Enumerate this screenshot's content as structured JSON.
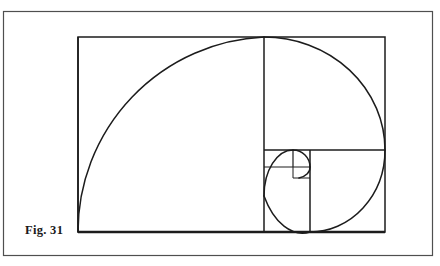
{
  "figure": {
    "caption": "Fig. 31",
    "ink_color": "#1c1c1c",
    "page_color": "#ffffff",
    "border_color": "#5a5a5a"
  },
  "chart_data": {
    "type": "diagram",
    "subtype": "golden-spiral",
    "title": "Fig. 31",
    "xlabel": "",
    "ylabel": "",
    "grid": false,
    "legend": null,
    "annotations": [
      "Fig. 31"
    ],
    "page_border": {
      "x": 3,
      "y": 11,
      "width": 429,
      "height": 244,
      "stroke_width": 1
    },
    "golden_rectangle": {
      "x": 78,
      "y": 37,
      "width": 307,
      "height": 195,
      "ratio": 1.574
    },
    "squares": [
      {
        "order": 1,
        "x": 78,
        "y": 37,
        "size": 186,
        "arc_from": "top-right",
        "arc_to": "bottom-left"
      },
      {
        "order": 2,
        "x": 264,
        "y": 37,
        "width": 121,
        "height": 113,
        "arc_from": "top-left",
        "arc_to": "bottom-right"
      },
      {
        "order": 3,
        "x": 310,
        "y": 150,
        "width": 75,
        "height": 82,
        "arc_from": "top-right",
        "arc_to": "bottom-left"
      },
      {
        "order": 4,
        "x": 264,
        "y": 150,
        "width": 46,
        "height": 46,
        "arc_from": "bottom-right",
        "arc_to": "top-left"
      },
      {
        "order": 5,
        "x": 264,
        "y": 150,
        "width": 29,
        "height": 17,
        "arc_from": "bottom-left",
        "arc_to": "top-right"
      },
      {
        "order": 6,
        "x": 293,
        "y": 150,
        "width": 17,
        "height": 17,
        "arc_from": "bottom-left",
        "arc_to": "top-right"
      },
      {
        "order": 7,
        "x": 293,
        "y": 167,
        "width": 17,
        "height": 11,
        "arc_from": "top-left",
        "arc_to": "bottom-right"
      }
    ],
    "divider_lines": [
      {
        "name": "vertical-main-split",
        "x1": 264,
        "y1": 37,
        "x2": 264,
        "y2": 232
      },
      {
        "name": "horizontal-right-split",
        "x1": 264,
        "y1": 150,
        "x2": 385,
        "y2": 150
      },
      {
        "name": "vertical-lower-split",
        "x1": 310,
        "y1": 150,
        "x2": 310,
        "y2": 232
      },
      {
        "name": "vertical-tiny-split",
        "x1": 293,
        "y1": 150,
        "x2": 293,
        "y2": 196
      },
      {
        "name": "horizontal-tiny-split",
        "x1": 264,
        "y1": 167,
        "x2": 310,
        "y2": 167
      },
      {
        "name": "horizontal-micro-split",
        "x1": 293,
        "y1": 178,
        "x2": 310,
        "y2": 178
      }
    ],
    "spiral_description": "Quarter-circle arcs chained across successively smaller nested squares, converging to the eye near (297,172)."
  }
}
